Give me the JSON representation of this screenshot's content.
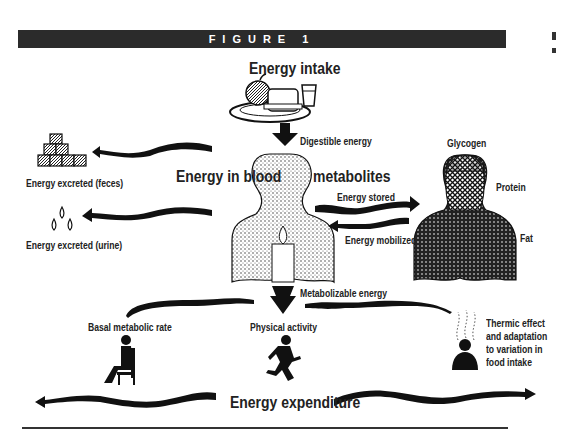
{
  "figure": {
    "banner_title": "FIGURE 1"
  },
  "diagram": {
    "intake": {
      "title": "Energy intake",
      "flow_label": "Digestible energy"
    },
    "blood": {
      "label_left": "Energy in blood",
      "label_right": "metabolites"
    },
    "excretion": {
      "feces": "Energy excreted (feces)",
      "urine": "Energy excreted (urine)"
    },
    "storage": {
      "stored_label": "Energy stored",
      "mobilized_label": "Energy mobilized",
      "components": [
        "Glycogen",
        "Protein",
        "Fat"
      ]
    },
    "metabolizable": {
      "label": "Metabolizable energy"
    },
    "expenditure": {
      "title": "Energy expenditure",
      "components": [
        {
          "label": "Basal metabolic rate",
          "icon": "seated-person-icon"
        },
        {
          "label": "Physical activity",
          "icon": "running-person-icon"
        },
        {
          "label_lines": [
            "Thermic effect",
            "and adaptation",
            "to variation in",
            "food intake"
          ],
          "icon": "heat-person-icon"
        }
      ]
    },
    "colors": {
      "ink": "#1a1a1a",
      "banner": "#2b2b2b",
      "background": "#ffffff"
    }
  }
}
